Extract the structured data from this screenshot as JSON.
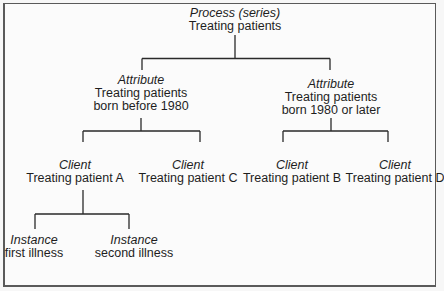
{
  "diagram": {
    "line_color": "#2a2a2a",
    "nodes": {
      "root": {
        "kind": "Process (series)",
        "lines": [
          "Treating patients"
        ]
      },
      "attr1": {
        "kind": "Attribute",
        "lines": [
          "Treating patients",
          "born before 1980"
        ]
      },
      "attr2": {
        "kind": "Attribute",
        "lines": [
          "Treating patients",
          "born 1980 or later"
        ]
      },
      "clientA": {
        "kind": "Client",
        "lines": [
          "Treating patient A"
        ]
      },
      "clientC": {
        "kind": "Client",
        "lines": [
          "Treating patient C"
        ]
      },
      "clientB": {
        "kind": "Client",
        "lines": [
          "Treating patient B"
        ]
      },
      "clientD": {
        "kind": "Client",
        "lines": [
          "Treating patient D"
        ]
      },
      "inst1": {
        "kind": "Instance",
        "lines": [
          "first illness"
        ]
      },
      "inst2": {
        "kind": "Instance",
        "lines": [
          "second illness"
        ]
      }
    },
    "edges": [
      [
        "root",
        "attr1"
      ],
      [
        "root",
        "attr2"
      ],
      [
        "attr1",
        "clientA"
      ],
      [
        "attr1",
        "clientC"
      ],
      [
        "attr2",
        "clientB"
      ],
      [
        "attr2",
        "clientD"
      ],
      [
        "clientA",
        "inst1"
      ],
      [
        "clientA",
        "inst2"
      ]
    ]
  }
}
